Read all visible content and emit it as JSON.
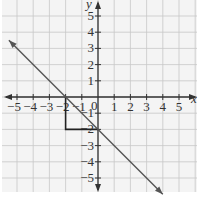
{
  "chart_data": {
    "type": "line",
    "title": "",
    "xlabel": "x",
    "ylabel": "y",
    "xlim": [
      -5.5,
      5.5
    ],
    "ylim": [
      -6,
      6
    ],
    "grid": true,
    "x_ticks": [
      -5,
      -4,
      -3,
      -2,
      -1,
      0,
      1,
      2,
      3,
      4,
      5
    ],
    "x_tick_labels": [
      "−5",
      "−4",
      "−3",
      "−2",
      "−1",
      "0",
      "1",
      "2",
      "3",
      "4",
      "5"
    ],
    "y_ticks": [
      5,
      4,
      3,
      2,
      1,
      -1,
      -2,
      -3,
      -4,
      -5
    ],
    "y_tick_labels": [
      "5",
      "4",
      "3",
      "2",
      "1",
      "−1",
      "−2",
      "−3",
      "−4",
      "−5"
    ],
    "origin_label": "0",
    "series": [
      {
        "name": "y = -x - 2",
        "slope": -1,
        "intercept": -2,
        "x": [
          -5.5,
          4
        ],
        "y": [
          3.5,
          -6
        ],
        "arrows": "both",
        "color": "#555555"
      }
    ],
    "annotations": [
      {
        "type": "slope-triangle",
        "points": [
          [
            -2,
            0
          ],
          [
            -2,
            -2
          ],
          [
            0,
            -2
          ]
        ],
        "rise": -2,
        "run": 2,
        "color": "#222222"
      }
    ]
  },
  "colors": {
    "grid": "#c8c8c8",
    "axis": "#333333",
    "line": "#555555",
    "triangle": "#222222",
    "background": "#f4f4f4"
  }
}
